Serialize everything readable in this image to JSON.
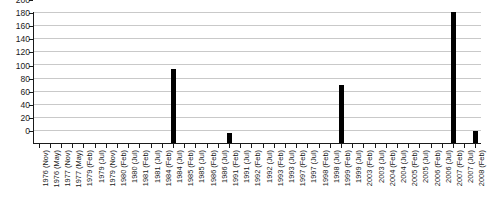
{
  "chart_data": {
    "type": "bar",
    "title": "",
    "subtitle": "",
    "xlabel": "",
    "ylabel": "",
    "ylim": [
      0,
      200
    ],
    "ytick_step": 20,
    "grid": true,
    "legend": null,
    "bar_color": "#000000",
    "grid_color": "#c9c9c9",
    "axis_color": "#1a1a1a",
    "yticks": [
      "0",
      "20",
      "40",
      "60",
      "80",
      "100",
      "120",
      "140",
      "160",
      "180",
      "200"
    ],
    "categories": [
      "1976 (Nov)",
      "1976 (May)",
      "1977 (Nov)",
      "1977 (May)",
      "1979 (Feb)",
      "1979 (Jul)",
      "1979 (Nov)",
      "1980 (Feb)",
      "1980 (Jul)",
      "1981 (Feb)",
      "1981 (Jul)",
      "1984 (Feb)",
      "1984 (Jul)",
      "1985 (Feb)",
      "1985 (Jul)",
      "1986 (Feb)",
      "1986 (Jul)",
      "1991 (Feb)",
      "1991 (Jul)",
      "1992 (Feb)",
      "1992 (Jul)",
      "1993 (Feb)",
      "1993 (Jul)",
      "1997 (Feb)",
      "1997 (Jul)",
      "1998 (Feb)",
      "1998 (Jul)",
      "1999 (Feb)",
      "1999 (Jul)",
      "2003 (Feb)",
      "2003 (Jul)",
      "2004 (Feb)",
      "2004 (Jul)",
      "2005 (Feb)",
      "2005 (Jul)",
      "2006 (Feb)",
      "2006 (Jul)",
      "2007 (Feb)",
      "2007 (Jul)",
      "2008 (Feb)"
    ],
    "values": [
      0,
      0,
      0,
      0,
      0,
      0,
      0,
      0,
      0,
      0,
      0,
      0,
      113,
      0,
      0,
      0,
      0,
      15,
      0,
      0,
      0,
      0,
      0,
      0,
      0,
      0,
      0,
      88,
      0,
      0,
      0,
      0,
      0,
      0,
      0,
      0,
      0,
      200,
      0,
      18
    ]
  }
}
